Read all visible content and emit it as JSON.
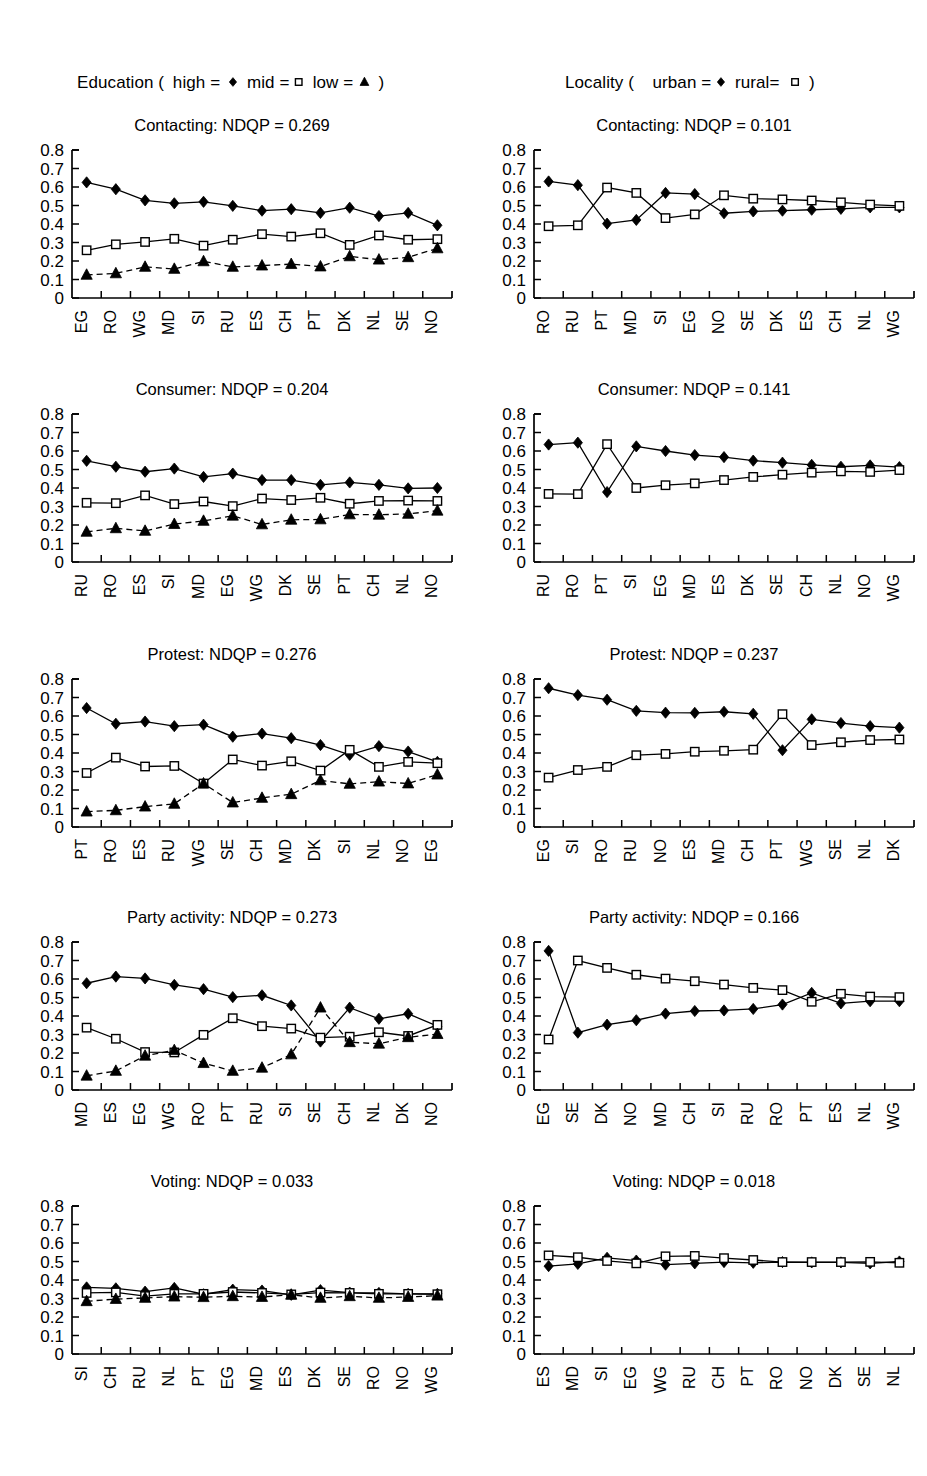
{
  "figure": {
    "width": 927,
    "height": 1476,
    "background": "#ffffff",
    "line_color": "#000000"
  },
  "columns": [
    {
      "id": "education",
      "header": "Education (high =  mid =  low = )",
      "header_parts": {
        "name": "Education",
        "open": "(",
        "items": [
          {
            "label": "high =",
            "marker": "diamond"
          },
          {
            "label": "mid =",
            "marker": "square"
          },
          {
            "label": "low =",
            "marker": "triangle"
          }
        ],
        "close": ")"
      }
    },
    {
      "id": "locality",
      "header": "Locality (urban =  rural=  )",
      "header_parts": {
        "name": "Locality",
        "open": "(",
        "items": [
          {
            "label": "urban =",
            "marker": "diamond"
          },
          {
            "label": "rural=",
            "marker": "square"
          }
        ],
        "close": ")"
      }
    }
  ],
  "axis": {
    "ylim": [
      0,
      0.8
    ],
    "yticks": [
      0,
      0.1,
      0.2,
      0.3,
      0.4,
      0.5,
      0.6,
      0.7,
      0.8
    ],
    "ytick_labels": [
      "0",
      "0.1",
      "0.2",
      "0.3",
      "0.4",
      "0.5",
      "0.6",
      "0.7",
      "0.8"
    ],
    "grid": false,
    "legend_position": "above-column",
    "xlabel": "",
    "ylabel": ""
  },
  "chart_data": [
    {
      "id": "contacting-education",
      "type": "line",
      "title": "Contacting: NDQP = 0.269",
      "ndqp": 0.269,
      "activity": "Contacting",
      "grouping": "Education",
      "xlabel": "",
      "ylabel": "",
      "ylim": [
        0,
        0.8
      ],
      "grid": false,
      "legend_position": "column-header",
      "categories": [
        "EG",
        "RO",
        "WG",
        "MD",
        "SI",
        "RU",
        "ES",
        "CH",
        "PT",
        "DK",
        "NL",
        "SE",
        "NO"
      ],
      "series": [
        {
          "name": "high",
          "marker": "diamond",
          "dash": false,
          "values": [
            0.625,
            0.588,
            0.528,
            0.512,
            0.52,
            0.498,
            0.472,
            0.48,
            0.46,
            0.488,
            0.443,
            0.46,
            0.393
          ]
        },
        {
          "name": "mid",
          "marker": "square",
          "dash": false,
          "values": [
            0.258,
            0.29,
            0.303,
            0.32,
            0.283,
            0.315,
            0.345,
            0.332,
            0.35,
            0.287,
            0.338,
            0.315,
            0.318
          ]
        },
        {
          "name": "low",
          "marker": "triangle",
          "dash": true,
          "values": [
            0.125,
            0.133,
            0.168,
            0.157,
            0.198,
            0.168,
            0.175,
            0.183,
            0.17,
            0.225,
            0.207,
            0.22,
            0.268
          ]
        }
      ]
    },
    {
      "id": "contacting-locality",
      "type": "line",
      "title": "Contacting: NDQP = 0.101",
      "ndqp": 0.101,
      "activity": "Contacting",
      "grouping": "Locality",
      "xlabel": "",
      "ylabel": "",
      "ylim": [
        0,
        0.8
      ],
      "grid": false,
      "legend_position": "column-header",
      "categories": [
        "RO",
        "RU",
        "PT",
        "MD",
        "SI",
        "EG",
        "NO",
        "SE",
        "DK",
        "ES",
        "CH",
        "NL",
        "WG"
      ],
      "series": [
        {
          "name": "urban",
          "marker": "diamond",
          "dash": false,
          "values": [
            0.63,
            0.61,
            0.402,
            0.422,
            0.568,
            0.562,
            0.458,
            0.468,
            0.472,
            0.477,
            0.482,
            0.49,
            0.49
          ]
        },
        {
          "name": "rural",
          "marker": "square",
          "dash": false,
          "values": [
            0.388,
            0.393,
            0.597,
            0.568,
            0.432,
            0.452,
            0.555,
            0.537,
            0.533,
            0.527,
            0.517,
            0.505,
            0.498
          ]
        }
      ]
    },
    {
      "id": "consumer-education",
      "type": "line",
      "title": "Consumer: NDQP = 0.204",
      "ndqp": 0.204,
      "activity": "Consumer",
      "grouping": "Education",
      "xlabel": "",
      "ylabel": "",
      "ylim": [
        0,
        0.8
      ],
      "grid": false,
      "legend_position": "column-header",
      "categories": [
        "RU",
        "RO",
        "ES",
        "SI",
        "MD",
        "EG",
        "WG",
        "DK",
        "SE",
        "PT",
        "CH",
        "NL",
        "NO"
      ],
      "series": [
        {
          "name": "high",
          "marker": "diamond",
          "dash": false,
          "values": [
            0.547,
            0.515,
            0.488,
            0.505,
            0.46,
            0.478,
            0.443,
            0.443,
            0.417,
            0.43,
            0.417,
            0.398,
            0.4
          ]
        },
        {
          "name": "mid",
          "marker": "square",
          "dash": false,
          "values": [
            0.32,
            0.318,
            0.36,
            0.313,
            0.327,
            0.302,
            0.343,
            0.335,
            0.347,
            0.315,
            0.33,
            0.332,
            0.33
          ]
        },
        {
          "name": "low",
          "marker": "triangle",
          "dash": true,
          "values": [
            0.163,
            0.182,
            0.168,
            0.205,
            0.222,
            0.25,
            0.203,
            0.228,
            0.23,
            0.257,
            0.255,
            0.26,
            0.277
          ]
        }
      ]
    },
    {
      "id": "consumer-locality",
      "type": "line",
      "title": "Consumer: NDQP = 0.141",
      "ndqp": 0.141,
      "activity": "Consumer",
      "grouping": "Locality",
      "xlabel": "",
      "ylabel": "",
      "ylim": [
        0,
        0.8
      ],
      "grid": false,
      "legend_position": "column-header",
      "categories": [
        "RU",
        "RO",
        "PT",
        "SI",
        "EG",
        "MD",
        "ES",
        "DK",
        "SE",
        "CH",
        "NL",
        "NO",
        "WG"
      ],
      "series": [
        {
          "name": "urban",
          "marker": "diamond",
          "dash": false,
          "values": [
            0.635,
            0.645,
            0.378,
            0.625,
            0.6,
            0.578,
            0.567,
            0.548,
            0.537,
            0.525,
            0.515,
            0.522,
            0.513
          ]
        },
        {
          "name": "rural",
          "marker": "square",
          "dash": false,
          "values": [
            0.368,
            0.367,
            0.637,
            0.4,
            0.415,
            0.425,
            0.443,
            0.46,
            0.472,
            0.483,
            0.49,
            0.487,
            0.497
          ]
        }
      ]
    },
    {
      "id": "protest-education",
      "type": "line",
      "title": "Protest: NDQP = 0.276",
      "ndqp": 0.276,
      "activity": "Protest",
      "grouping": "Education",
      "xlabel": "",
      "ylabel": "",
      "ylim": [
        0,
        0.8
      ],
      "grid": false,
      "legend_position": "column-header",
      "categories": [
        "PT",
        "RO",
        "ES",
        "RU",
        "WG",
        "SE",
        "CH",
        "MD",
        "DK",
        "SI",
        "NL",
        "NO",
        "EG"
      ],
      "series": [
        {
          "name": "high",
          "marker": "diamond",
          "dash": false,
          "values": [
            0.643,
            0.558,
            0.57,
            0.545,
            0.553,
            0.488,
            0.505,
            0.48,
            0.443,
            0.39,
            0.437,
            0.408,
            0.352
          ]
        },
        {
          "name": "mid",
          "marker": "square",
          "dash": false,
          "values": [
            0.292,
            0.375,
            0.327,
            0.33,
            0.235,
            0.365,
            0.332,
            0.355,
            0.305,
            0.417,
            0.325,
            0.352,
            0.345
          ]
        },
        {
          "name": "low",
          "marker": "triangle",
          "dash": true,
          "values": [
            0.083,
            0.09,
            0.11,
            0.125,
            0.235,
            0.132,
            0.157,
            0.177,
            0.252,
            0.233,
            0.245,
            0.235,
            0.283
          ]
        }
      ]
    },
    {
      "id": "protest-locality",
      "type": "line",
      "title": "Protest: NDQP = 0.237",
      "ndqp": 0.237,
      "activity": "Protest",
      "grouping": "Locality",
      "xlabel": "",
      "ylabel": "",
      "ylim": [
        0,
        0.8
      ],
      "grid": false,
      "legend_position": "column-header",
      "categories": [
        "EG",
        "SI",
        "RO",
        "RU",
        "NO",
        "ES",
        "MD",
        "CH",
        "PT",
        "WG",
        "SE",
        "NL",
        "DK"
      ],
      "series": [
        {
          "name": "urban",
          "marker": "diamond",
          "dash": false,
          "values": [
            0.75,
            0.713,
            0.688,
            0.628,
            0.618,
            0.617,
            0.623,
            0.612,
            0.415,
            0.582,
            0.562,
            0.545,
            0.537
          ]
        },
        {
          "name": "rural",
          "marker": "square",
          "dash": false,
          "values": [
            0.267,
            0.308,
            0.325,
            0.388,
            0.395,
            0.407,
            0.412,
            0.418,
            0.61,
            0.443,
            0.458,
            0.47,
            0.473
          ]
        }
      ]
    },
    {
      "id": "party-activity-education",
      "type": "line",
      "title": "Party activity: NDQP = 0.273",
      "ndqp": 0.273,
      "activity": "Party activity",
      "grouping": "Education",
      "xlabel": "",
      "ylabel": "",
      "ylim": [
        0,
        0.8
      ],
      "grid": false,
      "legend_position": "column-header",
      "categories": [
        "MD",
        "ES",
        "EG",
        "WG",
        "RO",
        "PT",
        "RU",
        "SI",
        "SE",
        "CH",
        "NL",
        "DK",
        "NO"
      ],
      "series": [
        {
          "name": "high",
          "marker": "diamond",
          "dash": false,
          "values": [
            0.577,
            0.613,
            0.603,
            0.568,
            0.545,
            0.502,
            0.512,
            0.457,
            0.262,
            0.445,
            0.385,
            0.412,
            0.345
          ]
        },
        {
          "name": "mid",
          "marker": "square",
          "dash": false,
          "values": [
            0.337,
            0.277,
            0.205,
            0.203,
            0.298,
            0.388,
            0.345,
            0.332,
            0.283,
            0.288,
            0.312,
            0.292,
            0.352
          ]
        },
        {
          "name": "low",
          "marker": "triangle",
          "dash": true,
          "values": [
            0.077,
            0.103,
            0.185,
            0.215,
            0.145,
            0.103,
            0.12,
            0.192,
            0.445,
            0.258,
            0.25,
            0.285,
            0.302
          ]
        }
      ]
    },
    {
      "id": "party-activity-locality",
      "type": "line",
      "title": "Party activity: NDQP = 0.166",
      "ndqp": 0.166,
      "activity": "Party activity",
      "grouping": "Locality",
      "xlabel": "",
      "ylabel": "",
      "ylim": [
        0,
        0.8
      ],
      "grid": false,
      "legend_position": "column-header",
      "categories": [
        "EG",
        "SE",
        "DK",
        "NO",
        "MD",
        "CH",
        "SI",
        "RU",
        "RO",
        "PT",
        "ES",
        "NL",
        "WG"
      ],
      "series": [
        {
          "name": "urban",
          "marker": "diamond",
          "dash": false,
          "values": [
            0.752,
            0.31,
            0.353,
            0.377,
            0.413,
            0.427,
            0.43,
            0.438,
            0.462,
            0.525,
            0.468,
            0.48,
            0.48
          ]
        },
        {
          "name": "rural",
          "marker": "square",
          "dash": false,
          "values": [
            0.273,
            0.7,
            0.66,
            0.623,
            0.602,
            0.588,
            0.57,
            0.552,
            0.54,
            0.477,
            0.52,
            0.505,
            0.502
          ]
        }
      ]
    },
    {
      "id": "voting-education",
      "type": "line",
      "title": "Voting: NDQP = 0.033",
      "ndqp": 0.033,
      "activity": "Voting",
      "grouping": "Education",
      "xlabel": "",
      "ylabel": "",
      "ylim": [
        0,
        0.8
      ],
      "grid": false,
      "legend_position": "column-header",
      "categories": [
        "SI",
        "CH",
        "RU",
        "NL",
        "PT",
        "EG",
        "MD",
        "ES",
        "DK",
        "SE",
        "RO",
        "NO",
        "WG"
      ],
      "series": [
        {
          "name": "high",
          "marker": "diamond",
          "dash": false,
          "values": [
            0.36,
            0.355,
            0.337,
            0.357,
            0.323,
            0.348,
            0.343,
            0.32,
            0.345,
            0.332,
            0.33,
            0.325,
            0.325
          ]
        },
        {
          "name": "mid",
          "marker": "square",
          "dash": false,
          "values": [
            0.33,
            0.333,
            0.313,
            0.325,
            0.325,
            0.335,
            0.33,
            0.322,
            0.332,
            0.33,
            0.325,
            0.325,
            0.323
          ]
        },
        {
          "name": "low",
          "marker": "triangle",
          "dash": true,
          "values": [
            0.285,
            0.297,
            0.303,
            0.31,
            0.307,
            0.312,
            0.308,
            0.32,
            0.303,
            0.312,
            0.303,
            0.308,
            0.315
          ]
        }
      ]
    },
    {
      "id": "voting-locality",
      "type": "line",
      "title": "Voting: NDQP = 0.018",
      "ndqp": 0.018,
      "activity": "Voting",
      "grouping": "Locality",
      "xlabel": "",
      "ylabel": "",
      "ylim": [
        0,
        0.8
      ],
      "grid": false,
      "legend_position": "column-header",
      "categories": [
        "ES",
        "MD",
        "SI",
        "EG",
        "WG",
        "RU",
        "CH",
        "PT",
        "RO",
        "NO",
        "DK",
        "SE",
        "NL"
      ],
      "series": [
        {
          "name": "urban",
          "marker": "diamond",
          "dash": false,
          "values": [
            0.475,
            0.487,
            0.52,
            0.505,
            0.483,
            0.49,
            0.497,
            0.493,
            0.497,
            0.495,
            0.495,
            0.49,
            0.5
          ]
        },
        {
          "name": "rural",
          "marker": "square",
          "dash": false,
          "values": [
            0.533,
            0.523,
            0.503,
            0.49,
            0.528,
            0.53,
            0.518,
            0.508,
            0.497,
            0.497,
            0.497,
            0.498,
            0.493
          ]
        }
      ]
    }
  ]
}
